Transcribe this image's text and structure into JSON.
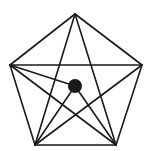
{
  "diagram": {
    "type": "graph",
    "vertices": [
      {
        "id": "top",
        "x": 75,
        "y": 14
      },
      {
        "id": "right",
        "x": 142,
        "y": 65
      },
      {
        "id": "bottom-right",
        "x": 116,
        "y": 145
      },
      {
        "id": "bottom-left",
        "x": 35,
        "y": 145
      },
      {
        "id": "left",
        "x": 10,
        "y": 65
      }
    ],
    "center_node": {
      "id": "center",
      "x": 75,
      "y": 86,
      "r": 7
    },
    "edges": [
      [
        "top",
        "right"
      ],
      [
        "right",
        "bottom-right"
      ],
      [
        "bottom-right",
        "bottom-left"
      ],
      [
        "bottom-left",
        "left"
      ],
      [
        "left",
        "top"
      ],
      [
        "top",
        "bottom-right"
      ],
      [
        "top",
        "bottom-left"
      ],
      [
        "left",
        "right"
      ],
      [
        "left",
        "bottom-right"
      ],
      [
        "right",
        "bottom-left"
      ],
      [
        "center",
        "left"
      ],
      [
        "center",
        "bottom-left"
      ],
      [
        "center",
        "bottom-right"
      ]
    ],
    "colors": {
      "stroke": "#1a1a1a",
      "background": "#ffffff"
    }
  }
}
